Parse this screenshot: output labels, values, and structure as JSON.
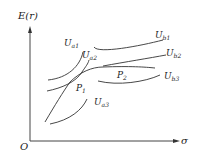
{
  "diagram": {
    "y_axis_label": "E(r)",
    "x_axis_label": "σ",
    "origin_label": "O",
    "curves": [
      {
        "id": "Ua1",
        "base": "U",
        "sub": "a1"
      },
      {
        "id": "Ua2",
        "base": "U",
        "sub": "a2"
      },
      {
        "id": "Ua3",
        "base": "U",
        "sub": "a3"
      },
      {
        "id": "Ub1",
        "base": "U",
        "sub": "b1"
      },
      {
        "id": "Ub2",
        "base": "U",
        "sub": "b2"
      },
      {
        "id": "Ub3",
        "base": "U",
        "sub": "b3"
      }
    ],
    "points": [
      {
        "id": "P1",
        "base": "P",
        "sub": "1"
      },
      {
        "id": "P2",
        "base": "P",
        "sub": "2"
      }
    ],
    "colors": {
      "stroke": "#333333",
      "background": "#ffffff"
    }
  }
}
